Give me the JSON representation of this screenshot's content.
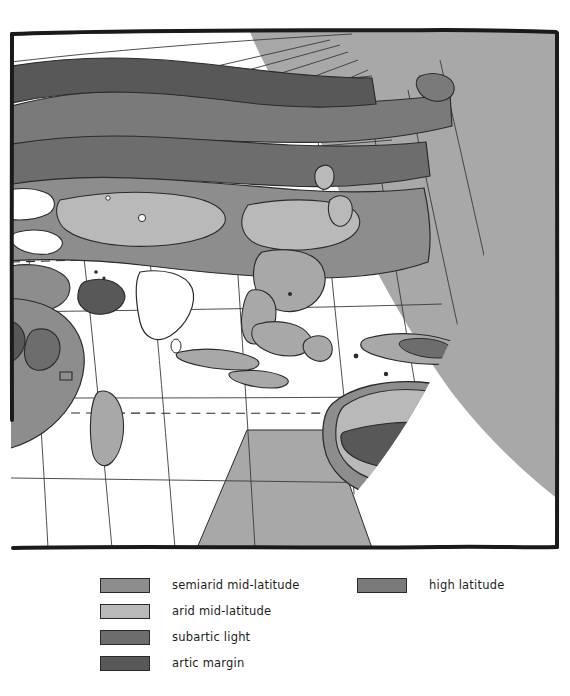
{
  "figure": {
    "kind": "hand-drawn world climate map",
    "region": "Eastern Hemisphere: Europe, Asia, Africa, Australia, Indonesia, New Zealand"
  },
  "map": {
    "frame_color": "#1a1a1a",
    "ocean_color": "#ffffff",
    "offglobe_color": "#a8a8a8",
    "graticule_color": "#3a3a3a",
    "coastline_color": "#2b2b2b",
    "tropic_line_style": "dashed",
    "equator_line_style": "solid"
  },
  "palette": {
    "semiarid_mid_latitude": "#8d8d8d",
    "arid_mid_latitude": "#b9b9b9",
    "subartic_light": "#6d6d6d",
    "artic_margin": "#585858",
    "high_latitude": "#7a7a7a"
  },
  "legend": {
    "left_entries": [
      {
        "label": "semiarid mid-latitude",
        "color": "#8d8d8d"
      },
      {
        "label": "arid mid-latitude",
        "color": "#b9b9b9"
      },
      {
        "label": "subartic light",
        "color": "#6d6d6d"
      },
      {
        "label": "artic margin",
        "color": "#585858"
      }
    ],
    "right_entries": [
      {
        "label": "high latitude",
        "color": "#7a7a7a"
      }
    ]
  }
}
